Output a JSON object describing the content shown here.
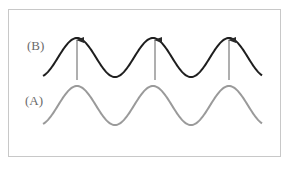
{
  "diagram": {
    "labels": {
      "b": "(B)",
      "a": "(A)"
    },
    "colors": {
      "wave_b": "#1e1e1e",
      "wave_a": "#9a9a9a",
      "arrow": "#7a7a7a",
      "frame": "#c8c8c8"
    },
    "wave_b": {
      "start_x": 43,
      "end_x": 262,
      "peak_y": 38,
      "trough_y": 77,
      "peaks_x": [
        77,
        155,
        229
      ]
    },
    "wave_a": {
      "start_x": 43,
      "end_x": 262,
      "peak_y": 86,
      "trough_y": 125,
      "peaks_x": [
        77,
        155,
        229
      ]
    },
    "arrows": [
      {
        "x": 77,
        "from_y": 80,
        "to_y": 40
      },
      {
        "x": 155,
        "from_y": 80,
        "to_y": 40
      },
      {
        "x": 229,
        "from_y": 80,
        "to_y": 40
      }
    ]
  }
}
